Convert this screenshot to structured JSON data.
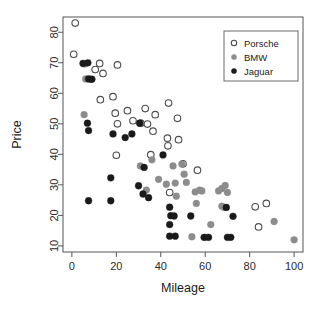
{
  "chart_data": {
    "type": "scatter",
    "title": "",
    "xlabel": "Mileage",
    "ylabel": "Price",
    "xlim": [
      -4,
      104
    ],
    "ylim": [
      8,
      85
    ],
    "xticks": [
      0,
      20,
      40,
      60,
      80,
      100
    ],
    "yticks": [
      10,
      20,
      30,
      40,
      50,
      60,
      70,
      80
    ],
    "grid": false,
    "legend_position": "top-right",
    "series": [
      {
        "name": "Porsche",
        "marker": "open-circle",
        "color": "#ffffff",
        "edge_color": "#4d4d4d",
        "points": [
          [
            1.5,
            83.0
          ],
          [
            0.8,
            72.8
          ],
          [
            12.5,
            69.8
          ],
          [
            20.5,
            69.3
          ],
          [
            10.5,
            67.8
          ],
          [
            14.0,
            66.5
          ],
          [
            18.5,
            58.9
          ],
          [
            12.8,
            57.9
          ],
          [
            19.5,
            53.5
          ],
          [
            25.0,
            54.3
          ],
          [
            33.0,
            55.0
          ],
          [
            37.5,
            53.0
          ],
          [
            43.5,
            56.8
          ],
          [
            20.5,
            50.0
          ],
          [
            27.5,
            51.0
          ],
          [
            31.0,
            50.2
          ],
          [
            34.0,
            49.9
          ],
          [
            36.5,
            47.6
          ],
          [
            47.5,
            51.8
          ],
          [
            43.0,
            45.3
          ],
          [
            43.2,
            42.8
          ],
          [
            48.0,
            44.8
          ],
          [
            35.5,
            39.9
          ],
          [
            50.0,
            36.9
          ],
          [
            20.0,
            39.7
          ],
          [
            56.5,
            34.8
          ],
          [
            44.0,
            27.5
          ],
          [
            82.5,
            22.8
          ],
          [
            87.5,
            23.9
          ],
          [
            84.0,
            16.2
          ]
        ]
      },
      {
        "name": "BMW",
        "marker": "filled-circle",
        "color": "#8c8c8c",
        "points": [
          [
            5.5,
            53.0
          ],
          [
            5.8,
            69.6
          ],
          [
            6.2,
            64.7
          ],
          [
            8.2,
            64.6
          ],
          [
            30.8,
            36.2
          ],
          [
            36.0,
            38.2
          ],
          [
            33.5,
            28.3
          ],
          [
            39.0,
            31.8
          ],
          [
            42.5,
            30.2
          ],
          [
            46.5,
            30.6
          ],
          [
            47.0,
            26.3
          ],
          [
            45.5,
            36.2
          ],
          [
            49.5,
            36.8
          ],
          [
            50.5,
            33.5
          ],
          [
            51.5,
            30.8
          ],
          [
            55.5,
            27.7
          ],
          [
            57.5,
            28.3
          ],
          [
            58.5,
            28.0
          ],
          [
            56.0,
            23.9
          ],
          [
            66.0,
            28.0
          ],
          [
            67.5,
            28.8
          ],
          [
            69.0,
            29.8
          ],
          [
            70.0,
            27.5
          ],
          [
            67.5,
            23.0
          ],
          [
            68.5,
            22.6
          ],
          [
            54.0,
            13.0
          ],
          [
            60.0,
            12.8
          ],
          [
            62.5,
            17.0
          ],
          [
            91.0,
            18.0
          ],
          [
            100.0,
            12.0
          ]
        ]
      },
      {
        "name": "Jaguar",
        "marker": "filled-circle",
        "color": "#1a1a1a",
        "points": [
          [
            5.0,
            69.8
          ],
          [
            7.2,
            70.0
          ],
          [
            7.5,
            64.7
          ],
          [
            9.0,
            64.6
          ],
          [
            7.0,
            50.2
          ],
          [
            7.5,
            47.8
          ],
          [
            18.5,
            46.7
          ],
          [
            24.0,
            45.5
          ],
          [
            27.0,
            46.7
          ],
          [
            30.5,
            50.2
          ],
          [
            17.5,
            32.3
          ],
          [
            30.0,
            29.7
          ],
          [
            32.0,
            27.0
          ],
          [
            34.5,
            25.8
          ],
          [
            32.5,
            35.7
          ],
          [
            41.0,
            39.8
          ],
          [
            44.0,
            22.7
          ],
          [
            44.5,
            19.9
          ],
          [
            46.0,
            19.8
          ],
          [
            44.0,
            17.0
          ],
          [
            7.5,
            24.8
          ],
          [
            17.5,
            24.8
          ],
          [
            44.0,
            13.2
          ],
          [
            46.5,
            13.2
          ],
          [
            53.5,
            19.8
          ],
          [
            59.5,
            12.8
          ],
          [
            61.5,
            12.8
          ],
          [
            70.0,
            12.8
          ],
          [
            71.5,
            12.8
          ],
          [
            69.5,
            22.6
          ],
          [
            72.5,
            19.7
          ]
        ]
      }
    ]
  },
  "legend": {
    "entries": [
      {
        "label": "Porsche",
        "marker": "open-circle"
      },
      {
        "label": "BMW",
        "marker": "gray-dot"
      },
      {
        "label": "Jaguar",
        "marker": "black-dot"
      }
    ]
  }
}
